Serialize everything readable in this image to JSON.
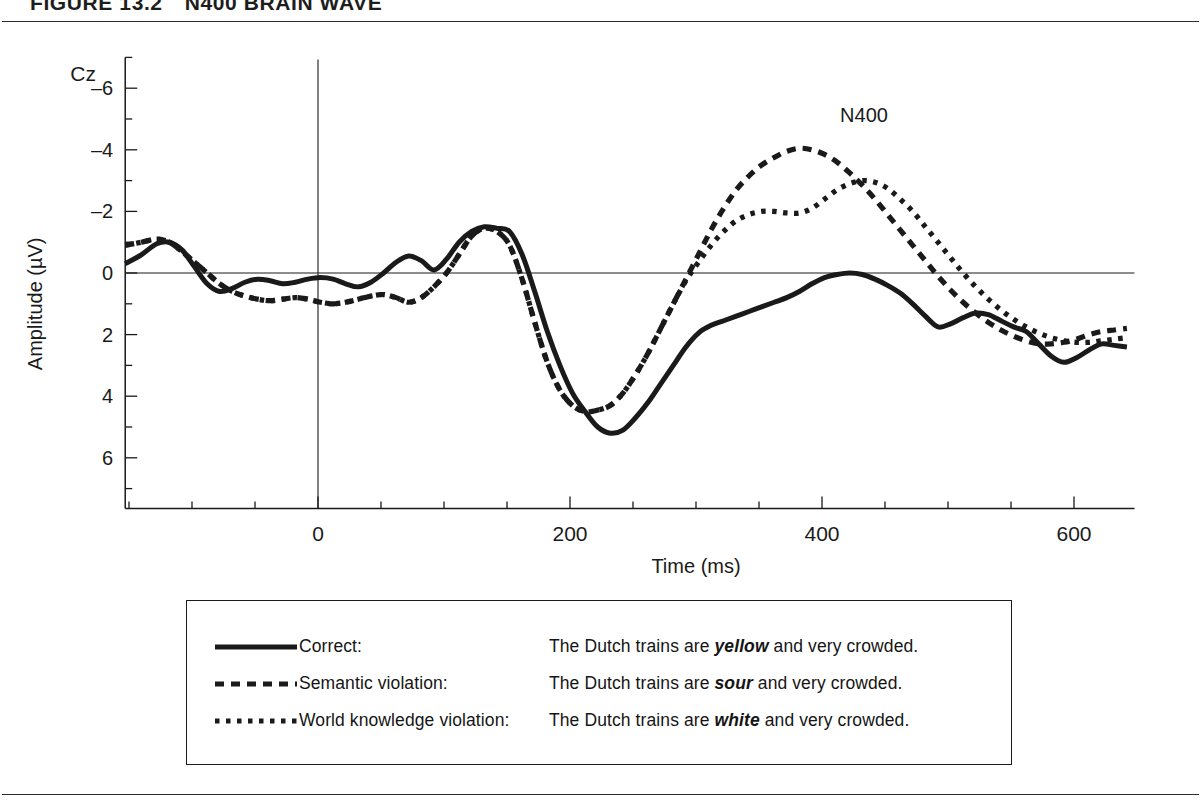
{
  "figure": {
    "label": "FIGURE 13.2",
    "title": "N400 BRAIN WAVE"
  },
  "chart_data": {
    "type": "line",
    "title": "N400 Brain Wave",
    "xlabel": "Time (ms)",
    "ylabel": "Amplitude (µV)",
    "electrode_label": "Cz",
    "xlim": [
      -153,
      648
    ],
    "ylim_display_top": -7,
    "ylim_display_bottom": 7,
    "y_axis_inverted": true,
    "xticks": [
      0,
      200,
      400,
      600
    ],
    "xtick_labels": [
      "0",
      "200",
      "400",
      "600"
    ],
    "xminor_step": 50,
    "yticks": [
      -6,
      -4,
      -2,
      0,
      2,
      4,
      6
    ],
    "ytick_labels": [
      "–6",
      "–4",
      "–2",
      "0",
      "2",
      "4",
      "6"
    ],
    "yminor_step": 1,
    "grid": false,
    "zero_line": true,
    "stimulus_onset_marker": 0,
    "annotations": [
      {
        "text": "N400",
        "x": 400,
        "y": -4.9
      }
    ],
    "legend_position": "below-plot-box",
    "series": [
      {
        "name": "Correct",
        "style": "solid",
        "sentence_prefix": "The Dutch trains are ",
        "sentence_critical": "yellow",
        "sentence_suffix": " and very crowded.",
        "x": [
          -153,
          -140,
          -128,
          -118,
          -108,
          -98,
          -88,
          -78,
          -68,
          -58,
          -48,
          -38,
          -28,
          -18,
          -8,
          2,
          12,
          22,
          32,
          42,
          52,
          62,
          72,
          82,
          92,
          102,
          112,
          122,
          132,
          142,
          152,
          162,
          172,
          182,
          192,
          202,
          212,
          222,
          232,
          242,
          252,
          262,
          272,
          282,
          292,
          302,
          312,
          322,
          332,
          342,
          352,
          362,
          372,
          382,
          392,
          402,
          412,
          422,
          432,
          442,
          452,
          462,
          472,
          482,
          492,
          502,
          512,
          522,
          532,
          542,
          552,
          562,
          572,
          582,
          592,
          602,
          612,
          622,
          632,
          642
        ],
        "y": [
          -0.3,
          -0.6,
          -0.95,
          -1.0,
          -0.75,
          -0.2,
          0.35,
          0.6,
          0.5,
          0.3,
          0.2,
          0.25,
          0.35,
          0.3,
          0.2,
          0.15,
          0.2,
          0.35,
          0.45,
          0.3,
          0.0,
          -0.35,
          -0.55,
          -0.4,
          -0.1,
          -0.45,
          -1.0,
          -1.35,
          -1.5,
          -1.45,
          -1.35,
          -0.6,
          0.6,
          1.9,
          3.0,
          3.9,
          4.5,
          5.0,
          5.2,
          5.1,
          4.7,
          4.2,
          3.6,
          3.0,
          2.4,
          1.95,
          1.7,
          1.55,
          1.4,
          1.25,
          1.1,
          0.95,
          0.8,
          0.6,
          0.35,
          0.15,
          0.05,
          0.0,
          0.05,
          0.2,
          0.4,
          0.65,
          1.0,
          1.4,
          1.75,
          1.65,
          1.45,
          1.3,
          1.35,
          1.55,
          1.75,
          1.9,
          2.3,
          2.7,
          2.9,
          2.75,
          2.5,
          2.3,
          2.35,
          2.4
        ]
      },
      {
        "name": "Semantic violation",
        "style": "dashed",
        "sentence_prefix": "The Dutch trains are ",
        "sentence_critical": "sour",
        "sentence_suffix": " and very crowded.",
        "x": [
          -153,
          -140,
          -128,
          -118,
          -108,
          -98,
          -88,
          -78,
          -68,
          -58,
          -48,
          -38,
          -28,
          -18,
          -8,
          2,
          12,
          22,
          32,
          42,
          52,
          62,
          72,
          82,
          92,
          102,
          112,
          122,
          132,
          142,
          152,
          162,
          172,
          182,
          192,
          202,
          212,
          222,
          232,
          242,
          252,
          262,
          272,
          282,
          292,
          302,
          312,
          322,
          332,
          342,
          352,
          362,
          372,
          382,
          392,
          402,
          412,
          422,
          432,
          442,
          452,
          462,
          472,
          482,
          492,
          502,
          512,
          522,
          532,
          542,
          552,
          562,
          572,
          582,
          592,
          602,
          612,
          622,
          632,
          642
        ],
        "y": [
          -0.9,
          -1.0,
          -1.1,
          -1.0,
          -0.7,
          -0.35,
          0.0,
          0.35,
          0.6,
          0.75,
          0.85,
          0.9,
          0.85,
          0.8,
          0.85,
          0.95,
          1.0,
          0.95,
          0.85,
          0.75,
          0.7,
          0.8,
          0.95,
          0.8,
          0.45,
          0.0,
          -0.6,
          -1.2,
          -1.45,
          -1.35,
          -0.9,
          0.2,
          1.6,
          2.9,
          3.8,
          4.3,
          4.5,
          4.45,
          4.3,
          3.9,
          3.3,
          2.6,
          1.8,
          1.0,
          0.2,
          -0.6,
          -1.4,
          -2.1,
          -2.7,
          -3.15,
          -3.5,
          -3.75,
          -3.95,
          -4.05,
          -4.0,
          -3.85,
          -3.6,
          -3.25,
          -2.85,
          -2.4,
          -1.9,
          -1.4,
          -0.9,
          -0.4,
          0.1,
          0.55,
          0.95,
          1.3,
          1.6,
          1.85,
          2.05,
          2.2,
          2.3,
          2.3,
          2.25,
          2.15,
          2.0,
          1.9,
          1.85,
          1.8
        ]
      },
      {
        "name": "World knowledge violation",
        "style": "dotted",
        "sentence_prefix": "The Dutch trains are ",
        "sentence_critical": "white",
        "sentence_suffix": " and very crowded.",
        "x": [
          -153,
          -140,
          -128,
          -118,
          -108,
          -98,
          -88,
          -78,
          -68,
          -58,
          -48,
          -38,
          -28,
          -18,
          -8,
          2,
          12,
          22,
          32,
          42,
          52,
          62,
          72,
          82,
          92,
          102,
          112,
          122,
          132,
          142,
          152,
          162,
          172,
          182,
          192,
          202,
          212,
          222,
          232,
          242,
          252,
          262,
          272,
          282,
          292,
          302,
          312,
          322,
          332,
          342,
          352,
          362,
          372,
          382,
          392,
          402,
          412,
          422,
          432,
          442,
          452,
          462,
          472,
          482,
          492,
          502,
          512,
          522,
          532,
          542,
          552,
          562,
          572,
          582,
          592,
          602,
          612,
          622,
          632,
          642
        ],
        "y": [
          -0.9,
          -1.0,
          -1.1,
          -1.0,
          -0.7,
          -0.35,
          0.0,
          0.35,
          0.6,
          0.75,
          0.85,
          0.9,
          0.85,
          0.8,
          0.85,
          0.95,
          1.0,
          0.95,
          0.85,
          0.75,
          0.7,
          0.8,
          0.95,
          0.8,
          0.45,
          0.0,
          -0.6,
          -1.2,
          -1.45,
          -1.35,
          -0.9,
          0.2,
          1.6,
          2.9,
          3.8,
          4.3,
          4.5,
          4.45,
          4.3,
          3.9,
          3.3,
          2.6,
          1.8,
          1.0,
          0.25,
          -0.35,
          -0.9,
          -1.35,
          -1.7,
          -1.9,
          -2.0,
          -2.0,
          -1.95,
          -1.95,
          -2.1,
          -2.4,
          -2.7,
          -2.9,
          -3.0,
          -2.95,
          -2.75,
          -2.4,
          -2.0,
          -1.5,
          -1.0,
          -0.5,
          0.0,
          0.45,
          0.85,
          1.2,
          1.5,
          1.75,
          1.95,
          2.1,
          2.2,
          2.25,
          2.25,
          2.2,
          2.15,
          2.1
        ]
      }
    ]
  },
  "legend": {
    "rows": [
      {
        "sample": "solid-line-sample",
        "label": "Correct:",
        "prefix": "The Dutch trains are ",
        "critical": "yellow",
        "suffix": " and very crowded."
      },
      {
        "sample": "dashed-line-sample",
        "label": "Semantic violation:",
        "prefix": "The Dutch trains are ",
        "critical": "sour",
        "suffix": " and very crowded."
      },
      {
        "sample": "dotted-line-sample",
        "label": "World knowledge violation:",
        "prefix": "The Dutch trains are ",
        "critical": "white",
        "suffix": " and very crowded."
      }
    ]
  },
  "colors": {
    "ink": "#1a1a1a",
    "rule": "#2b2b2b",
    "background": "#ffffff"
  }
}
